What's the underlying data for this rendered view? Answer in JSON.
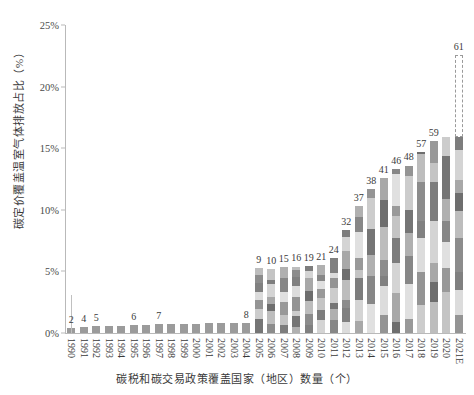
{
  "chart_data": {
    "type": "bar",
    "title": "",
    "subtitle": "",
    "xlabel": "碳税和碳交易政策覆盖国家（地区）数量（个）",
    "ylabel": "碳定价覆盖温室气体排放占比（%）",
    "ylim": [
      0,
      25
    ],
    "ytick_labels": [
      "0%",
      "5%",
      "10%",
      "15%",
      "20%",
      "25%"
    ],
    "ytick_values": [
      0,
      5,
      10,
      15,
      20,
      25
    ],
    "grid": false,
    "legend": "none",
    "bar_style": "stacked",
    "note": "Bar heights are share of global GHG emissions covered (%); data labels above bars are the cumulative number of carbon tax / ETS jurisdictions.",
    "categories": [
      "1990",
      "1991",
      "1992",
      "1993",
      "1994",
      "1995",
      "1996",
      "1997",
      "1998",
      "1999",
      "2000",
      "2001",
      "2002",
      "2003",
      "2004",
      "2005",
      "2006",
      "2007",
      "2008",
      "2009",
      "2010",
      "2011",
      "2012",
      "2013",
      "2014",
      "2015",
      "2016",
      "2017",
      "2018",
      "2019",
      "2020",
      "2021E"
    ],
    "count_labels": [
      "2",
      "4",
      "5",
      "",
      "",
      "6",
      "",
      "7",
      "",
      "",
      "",
      "",
      "",
      "",
      "8",
      "9",
      "10",
      "15",
      "16",
      "19",
      "21",
      "24",
      "32",
      "37",
      "38",
      "41",
      "46",
      "48",
      "57",
      "59",
      "",
      ""
    ],
    "counts": [
      2,
      4,
      5,
      5,
      5,
      6,
      6,
      7,
      7,
      7,
      7,
      7,
      7,
      7,
      8,
      9,
      10,
      15,
      16,
      19,
      21,
      24,
      32,
      37,
      38,
      41,
      46,
      48,
      57,
      59,
      59,
      61
    ],
    "values": [
      0.42,
      0.5,
      0.55,
      0.58,
      0.6,
      0.62,
      0.65,
      0.7,
      0.72,
      0.74,
      0.76,
      0.78,
      0.8,
      0.82,
      0.85,
      5.3,
      5.2,
      5.35,
      5.4,
      5.45,
      5.55,
      6.1,
      8.4,
      10.3,
      11.7,
      12.6,
      13.3,
      13.6,
      14.7,
      15.6,
      15.9,
      22.6
    ],
    "stack_palette": [
      "#8c8c8c",
      "#bdbdbd",
      "#6e6e6e",
      "#a8a8a8",
      "#d4d4d4",
      "#7d7d7d",
      "#c4c4c4",
      "#999999",
      "#e0e0e0",
      "#878787",
      "#b0b0b0",
      "#757575",
      "#cccccc",
      "#949494",
      "#dcdcdc",
      "#808080"
    ],
    "last_bar_projected": true,
    "last_bar_label": "61"
  }
}
